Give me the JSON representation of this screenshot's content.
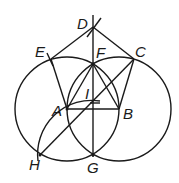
{
  "diagram": {
    "type": "geometric-construction",
    "stroke_color": "#1a1a1a",
    "points": {
      "A": {
        "label": "A",
        "x": 67,
        "y": 109
      },
      "B": {
        "label": "B",
        "x": 119,
        "y": 109
      },
      "C": {
        "label": "C",
        "x": 134,
        "y": 59
      },
      "D": {
        "label": "D",
        "x": 93,
        "y": 27
      },
      "E": {
        "label": "E",
        "x": 51,
        "y": 59
      },
      "F": {
        "label": "F",
        "x": 93,
        "y": 64
      },
      "G": {
        "label": "G",
        "x": 93,
        "y": 155
      },
      "H": {
        "label": "H",
        "x": 40,
        "y": 155
      },
      "I": {
        "label": "I",
        "x": 93,
        "y": 101
      }
    },
    "labels": {
      "A": "A",
      "B": "B",
      "C": "C",
      "D": "D",
      "E": "E",
      "F": "F",
      "G": "G",
      "H": "H",
      "I": "I"
    }
  }
}
